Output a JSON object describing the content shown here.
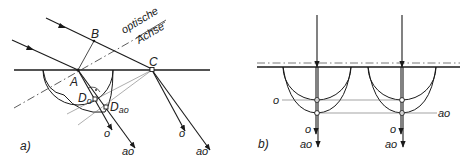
{
  "panel_a": {
    "caption": "a)",
    "points": {
      "A": "A",
      "B": "B",
      "C": "C",
      "D_o": "D",
      "D_o_sub": "o",
      "D_ao": "D",
      "D_ao_sub": "ao"
    },
    "axis_label_line1": "optische",
    "axis_label_line2": "Achse",
    "ray_labels": {
      "A_o": "o",
      "A_ao": "ao",
      "C_o": "o",
      "C_ao": "ao"
    }
  },
  "panel_b": {
    "caption": "b)",
    "left_o_marker": "o",
    "right_ao_marker": "ao",
    "ray_labels": {
      "left_o": "o",
      "left_ao": "ao",
      "right_o": "o",
      "right_ao": "ao"
    }
  },
  "colors": {
    "line": "#1a1a1a",
    "thin_line": "#555555",
    "background": "#ffffff"
  }
}
